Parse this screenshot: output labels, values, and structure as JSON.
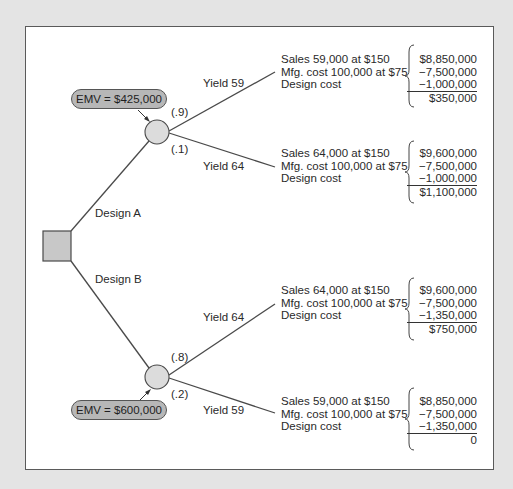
{
  "diagram": {
    "type": "decision-tree",
    "decision_node": {
      "label": "Decision"
    },
    "branches": [
      {
        "name": "Design A",
        "emv": "EMV = $425,000",
        "outcomes": [
          {
            "yield_label": "Yield 59",
            "probability": "(.9)",
            "lines": [
              "Sales 59,000 at $150",
              "Mfg. cost 100,000 at $75",
              "Design cost"
            ],
            "values": [
              "$8,850,000",
              "−7,500,000",
              "−1,000,000"
            ],
            "total": "$350,000"
          },
          {
            "yield_label": "Yield 64",
            "probability": "(.1)",
            "lines": [
              "Sales 64,000 at $150",
              "Mfg. cost 100,000 at $75",
              "Design cost"
            ],
            "values": [
              "$9,600,000",
              "−7,500,000",
              "−1,000,000"
            ],
            "total": "$1,100,000"
          }
        ]
      },
      {
        "name": "Design B",
        "emv": "EMV = $600,000",
        "outcomes": [
          {
            "yield_label": "Yield 64",
            "probability": "(.8)",
            "lines": [
              "Sales 64,000 at $150",
              "Mfg. cost 100,000 at $75",
              "Design cost"
            ],
            "values": [
              "$9,600,000",
              "−7,500,000",
              "−1,350,000"
            ],
            "total": "$750,000"
          },
          {
            "yield_label": "Yield 59",
            "probability": "(.2)",
            "lines": [
              "Sales 59,000 at $150",
              "Mfg. cost 100,000 at $75",
              "Design cost"
            ],
            "values": [
              "$8,850,000",
              "−7,500,000",
              "−1,350,000"
            ],
            "total": "0"
          }
        ]
      }
    ]
  },
  "colors": {
    "background": "#e4e4e4",
    "panel": "#ffffff",
    "node_fill": "#d9d9d9",
    "emv_fill": "#b7b7b7",
    "line": "#4a4a4a"
  }
}
